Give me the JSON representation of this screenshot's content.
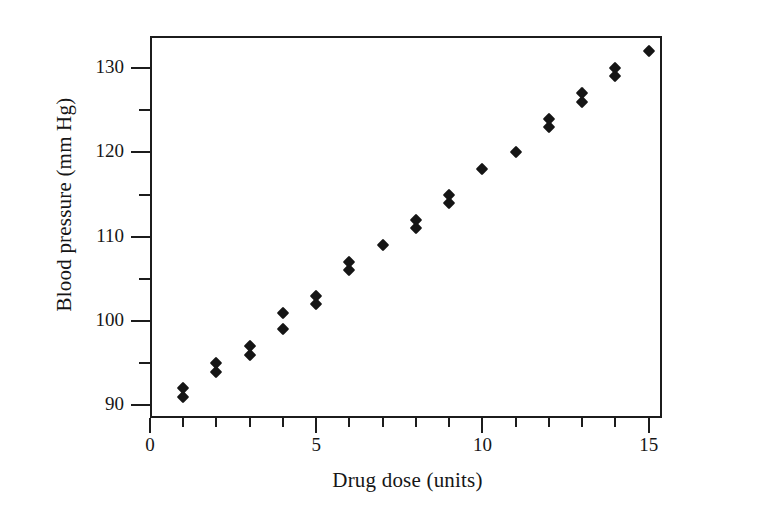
{
  "chart_data": {
    "type": "scatter",
    "title": "",
    "xlabel": "Drug dose (units)",
    "ylabel": "Blood pressure (mm Hg)",
    "xlim": [
      0,
      15.4
    ],
    "ylim": [
      88.5,
      133.8
    ],
    "grid": false,
    "legend": null,
    "marker": "filled-diamond",
    "marker_color": "#151515",
    "x_ticks_major": [
      0,
      5,
      10,
      15
    ],
    "x_tick_labels": [
      "0",
      "5",
      "10",
      "15"
    ],
    "x_ticks_minor": [
      1,
      2,
      3,
      4,
      6,
      7,
      8,
      9,
      11,
      12,
      13,
      14
    ],
    "y_ticks_major": [
      90,
      100,
      110,
      120,
      130
    ],
    "y_tick_labels": [
      "90",
      "100",
      "110",
      "120",
      "130"
    ],
    "y_ticks_minor": [
      95,
      105,
      115,
      125
    ],
    "points": [
      {
        "x": 1,
        "y": 91
      },
      {
        "x": 1,
        "y": 92
      },
      {
        "x": 2,
        "y": 94
      },
      {
        "x": 2,
        "y": 95
      },
      {
        "x": 3,
        "y": 96
      },
      {
        "x": 3,
        "y": 97
      },
      {
        "x": 4,
        "y": 99
      },
      {
        "x": 4,
        "y": 101
      },
      {
        "x": 5,
        "y": 102
      },
      {
        "x": 5,
        "y": 103
      },
      {
        "x": 6,
        "y": 106
      },
      {
        "x": 6,
        "y": 107
      },
      {
        "x": 7,
        "y": 109
      },
      {
        "x": 8,
        "y": 111
      },
      {
        "x": 8,
        "y": 112
      },
      {
        "x": 9,
        "y": 114
      },
      {
        "x": 9,
        "y": 115
      },
      {
        "x": 10,
        "y": 118
      },
      {
        "x": 11,
        "y": 120
      },
      {
        "x": 12,
        "y": 123
      },
      {
        "x": 12,
        "y": 124
      },
      {
        "x": 13,
        "y": 126
      },
      {
        "x": 13,
        "y": 127
      },
      {
        "x": 14,
        "y": 129
      },
      {
        "x": 14,
        "y": 130
      },
      {
        "x": 15,
        "y": 132
      }
    ]
  },
  "figure": {
    "background_color": "#ffffff",
    "axis_color": "#1c1c1c",
    "text_color": "#161616"
  }
}
